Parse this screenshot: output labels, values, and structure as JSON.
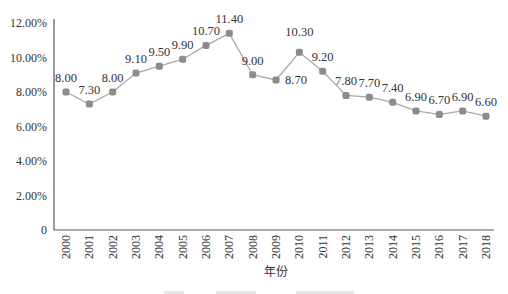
{
  "chart_data": {
    "type": "line",
    "title": "",
    "xlabel": "年份",
    "ylabel": "",
    "x": [
      "2000",
      "2001",
      "2002",
      "2003",
      "2004",
      "2005",
      "2006",
      "2007",
      "2008",
      "2009",
      "2010",
      "2011",
      "2012",
      "2013",
      "2014",
      "2015",
      "2016",
      "2017",
      "2018"
    ],
    "series": [
      {
        "name": "growth",
        "values": [
          8.0,
          7.3,
          8.0,
          9.1,
          9.5,
          9.9,
          10.7,
          11.4,
          9.0,
          8.7,
          10.3,
          9.2,
          7.8,
          7.7,
          7.4,
          6.9,
          6.7,
          6.9,
          6.6
        ],
        "data_labels": [
          "8.00",
          "7.30",
          "8.00",
          "9.10",
          "9.50",
          "9.90",
          "10.70",
          "11.40",
          "9.00",
          "8.70",
          "10.30",
          "9.20",
          "7.80",
          "7.70",
          "7.40",
          "6.90",
          "6.70",
          "6.90",
          "6.60"
        ]
      }
    ],
    "ylim": [
      0,
      12
    ],
    "yticks": [
      0,
      2,
      4,
      6,
      8,
      10,
      12
    ],
    "ytick_labels": [
      "0",
      "2.00%",
      "4.00%",
      "6.00%",
      "8.00%",
      "10.00%",
      "12.00%"
    ],
    "grid": false,
    "legend": "none",
    "colors": {
      "line": "#a9a9a9",
      "marker": "#8c8c8c",
      "axis": "#555555",
      "text": "#333333"
    }
  }
}
